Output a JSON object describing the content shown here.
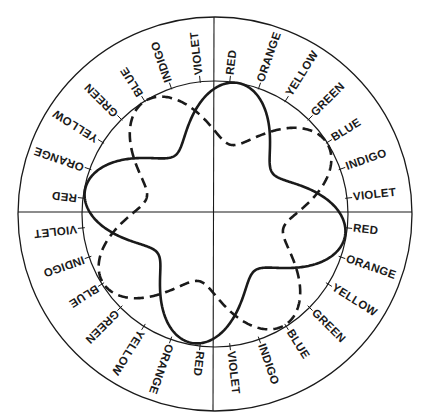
{
  "diagram": {
    "title": "",
    "color_sequence": [
      "RED",
      "ORANGE",
      "YELLOW",
      "GREEN",
      "BLUE",
      "INDIGO",
      "VIOLET"
    ],
    "quadrants": 4,
    "ring_labels": [
      "RED",
      "ORANGE",
      "YELLOW",
      "GREEN",
      "BLUE",
      "INDIGO",
      "VIOLET",
      "RED",
      "ORANGE",
      "YELLOW",
      "GREEN",
      "BLUE",
      "INDIGO",
      "VIOLET",
      "RED",
      "ORANGE",
      "YELLOW",
      "GREEN",
      "BLUE",
      "INDIGO",
      "VIOLET",
      "RED",
      "ORANGE",
      "YELLOW",
      "GREEN",
      "BLUE",
      "INDIGO",
      "VIOLET"
    ],
    "curves": [
      {
        "name": "solid-wave",
        "style": "solid",
        "lobes": 4,
        "lobe_start_label": "RED"
      },
      {
        "name": "dashed-wave",
        "style": "dashed",
        "lobes": 4,
        "lobe_start_label": "BLUE"
      }
    ],
    "ink_color": "#1a1a1a"
  }
}
